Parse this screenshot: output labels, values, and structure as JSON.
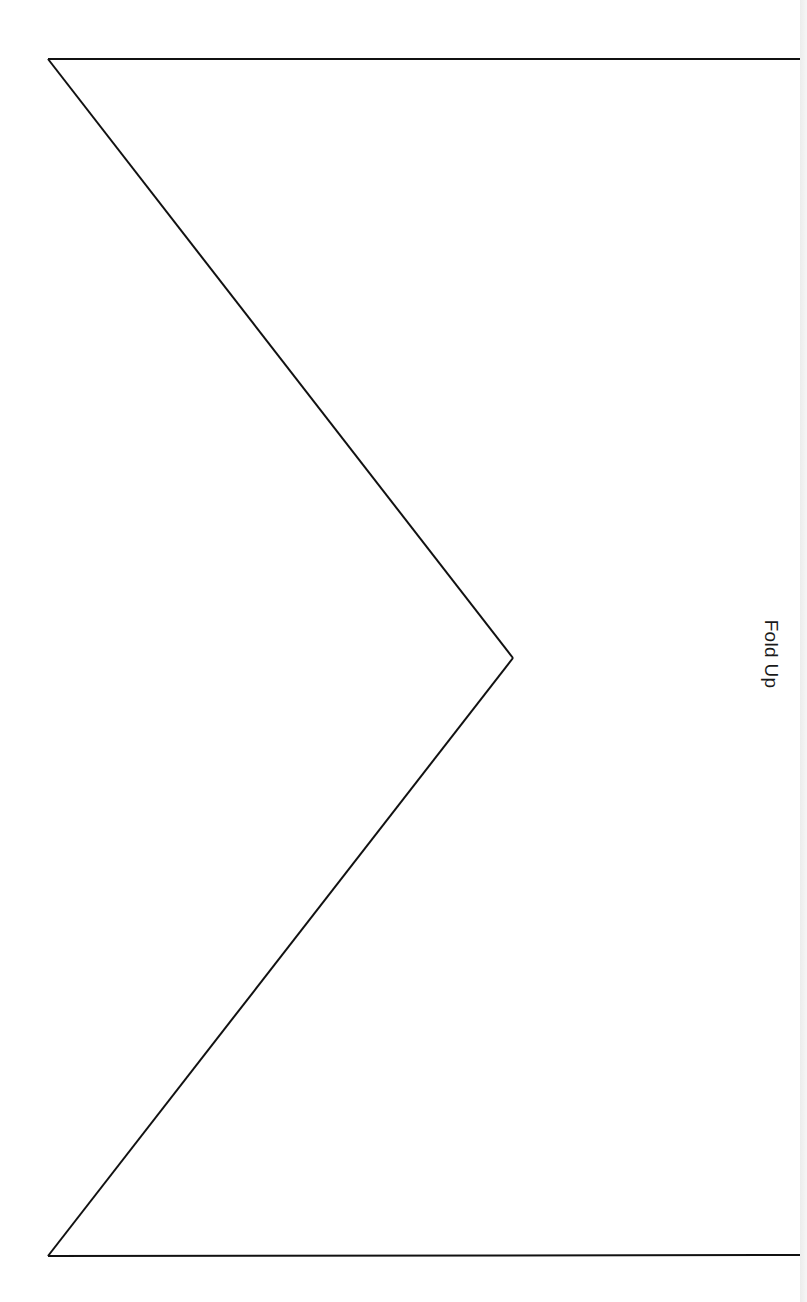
{
  "document": {
    "type": "fold template",
    "fold_label": "Fold Up",
    "fold_label_orientation": "rotated 90deg clockwise",
    "outline": {
      "stroke_color": "#111111",
      "top_left": [
        48,
        59
      ],
      "top_right": [
        800,
        59
      ],
      "apex": [
        513,
        658
      ],
      "bottom_left": [
        48,
        1256
      ],
      "bottom_right": [
        800,
        1255
      ]
    },
    "colors": {
      "background": "#ffffff",
      "line": "#111111",
      "edge_shadow": "#ececec"
    }
  }
}
